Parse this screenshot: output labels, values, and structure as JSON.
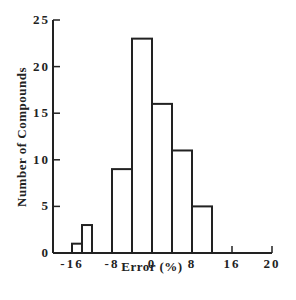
{
  "chart_data": {
    "type": "bar",
    "subtype": "histogram",
    "title": "",
    "xlabel": "Error (%)",
    "ylabel": "Number of Compounds",
    "xlim": [
      -20,
      20
    ],
    "ylim": [
      0,
      25
    ],
    "x_ticks": [
      "-16",
      "-8",
      "0",
      "8",
      "16",
      "20"
    ],
    "y_ticks": [
      "0",
      "5",
      "10",
      "15",
      "20",
      "25"
    ],
    "grid": false,
    "legend": null,
    "bins": [
      {
        "range": [
          -16,
          -14
        ],
        "value": 1
      },
      {
        "range": [
          -14,
          -12
        ],
        "value": 3
      },
      {
        "range": [
          -8,
          -4
        ],
        "value": 9
      },
      {
        "range": [
          -4,
          0
        ],
        "value": 23
      },
      {
        "range": [
          0,
          4
        ],
        "value": 16
      },
      {
        "range": [
          4,
          8
        ],
        "value": 11
      },
      {
        "range": [
          8,
          12
        ],
        "value": 5
      }
    ],
    "categories": [
      "-16 to -14",
      "-14 to -12",
      "-8 to -4",
      "-4 to 0",
      "0 to 4",
      "4 to 8",
      "8 to 12"
    ],
    "values": [
      1,
      3,
      9,
      23,
      16,
      11,
      5
    ],
    "colors": {
      "bar_fill": "#ffffff",
      "bar_stroke": "#222222",
      "axis": "#222222"
    }
  },
  "labels": {
    "xlabel": "Error (%)",
    "ylabel": "Number of Compounds",
    "x_ticks": [
      "-16",
      "-8",
      "0",
      "8",
      "16",
      "20"
    ],
    "y_ticks": [
      "0",
      "5",
      "10",
      "15",
      "20",
      "25"
    ]
  }
}
